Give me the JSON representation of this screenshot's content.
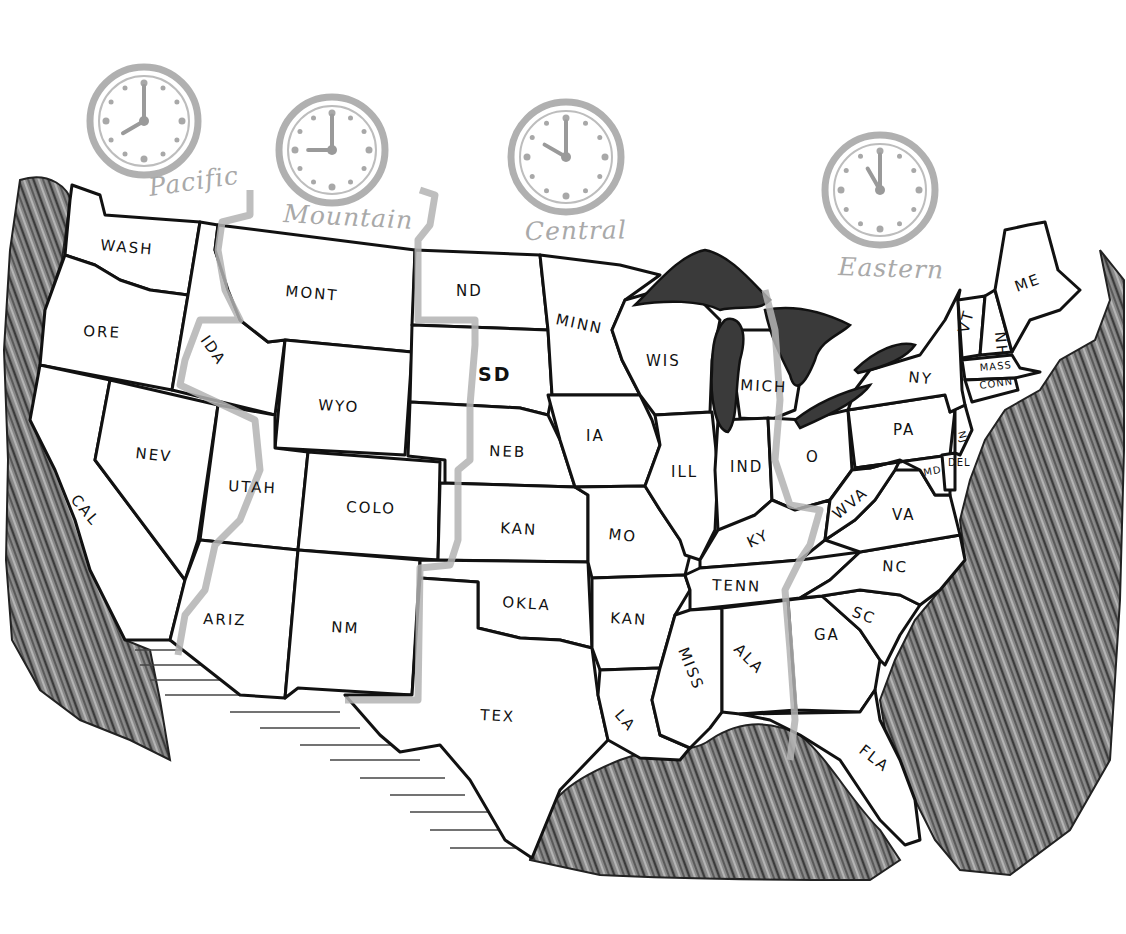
{
  "map": {
    "title": "United States Time Zones",
    "background": "#ffffff",
    "line_color": "#111111",
    "timezone_color": "#a9a9a9",
    "water_color": "#3a3a3a"
  },
  "time_zones": [
    {
      "id": "pacific",
      "label": "Pacific",
      "clock_cx": 144,
      "clock_cy": 121,
      "r": 54,
      "hour": 8,
      "minute": 0,
      "label_x": 150,
      "label_y": 196,
      "label_rot": -8
    },
    {
      "id": "mountain",
      "label": "Mountain",
      "clock_cx": 332,
      "clock_cy": 150,
      "r": 53,
      "hour": 9,
      "minute": 0,
      "label_x": 283,
      "label_y": 222,
      "label_rot": 3
    },
    {
      "id": "central",
      "label": "Central",
      "clock_cx": 566,
      "clock_cy": 157,
      "r": 55,
      "hour": 10,
      "minute": 0,
      "label_x": 525,
      "label_y": 240,
      "label_rot": -1
    },
    {
      "id": "eastern",
      "label": "Eastern",
      "clock_cx": 880,
      "clock_cy": 190,
      "r": 55,
      "hour": 11,
      "minute": 0,
      "label_x": 838,
      "label_y": 275,
      "label_rot": 2
    }
  ],
  "states": [
    {
      "id": "wa",
      "label": "WASH",
      "x": 100,
      "y": 250,
      "rot": 5
    },
    {
      "id": "or",
      "label": "ORE",
      "x": 83,
      "y": 336,
      "rot": 3
    },
    {
      "id": "ca",
      "label": "CAL",
      "x": 70,
      "y": 500,
      "rot": 50
    },
    {
      "id": "nv",
      "label": "NEV",
      "x": 135,
      "y": 458,
      "rot": 6
    },
    {
      "id": "id",
      "label": "IDA",
      "x": 200,
      "y": 340,
      "rot": 55
    },
    {
      "id": "mt",
      "label": "MONT",
      "x": 285,
      "y": 296,
      "rot": 5
    },
    {
      "id": "wy",
      "label": "WYO",
      "x": 318,
      "y": 410,
      "rot": 3
    },
    {
      "id": "ut",
      "label": "UTAH",
      "x": 228,
      "y": 491,
      "rot": 3
    },
    {
      "id": "co",
      "label": "COLO",
      "x": 346,
      "y": 512,
      "rot": 2
    },
    {
      "id": "az",
      "label": "ARIZ",
      "x": 203,
      "y": 624,
      "rot": 2
    },
    {
      "id": "nm",
      "label": "NM",
      "x": 331,
      "y": 632,
      "rot": 3
    },
    {
      "id": "nd",
      "label": "ND",
      "x": 456,
      "y": 296,
      "rot": 0
    },
    {
      "id": "sd",
      "label": "SD",
      "x": 478,
      "y": 381,
      "rot": 0,
      "style": "big"
    },
    {
      "id": "ne",
      "label": "NEB",
      "x": 489,
      "y": 456,
      "rot": 2
    },
    {
      "id": "ks",
      "label": "KAN",
      "x": 500,
      "y": 533,
      "rot": 3
    },
    {
      "id": "ok",
      "label": "OKLA",
      "x": 502,
      "y": 607,
      "rot": 4
    },
    {
      "id": "tx",
      "label": "TEX",
      "x": 480,
      "y": 720,
      "rot": 3
    },
    {
      "id": "mn",
      "label": "MINN",
      "x": 555,
      "y": 324,
      "rot": 12
    },
    {
      "id": "ia",
      "label": "IA",
      "x": 586,
      "y": 441,
      "rot": 0
    },
    {
      "id": "mo",
      "label": "MO",
      "x": 608,
      "y": 539,
      "rot": 6
    },
    {
      "id": "ar",
      "label": "KAN",
      "x": 610,
      "y": 623,
      "rot": 3
    },
    {
      "id": "la",
      "label": "LA",
      "x": 614,
      "y": 715,
      "rot": 50
    },
    {
      "id": "wi",
      "label": "WIS",
      "x": 646,
      "y": 366,
      "rot": 0
    },
    {
      "id": "il",
      "label": "ILL",
      "x": 671,
      "y": 477,
      "rot": 0
    },
    {
      "id": "mi",
      "label": "MICH",
      "x": 740,
      "y": 390,
      "rot": 3
    },
    {
      "id": "in",
      "label": "IND",
      "x": 730,
      "y": 472,
      "rot": 0
    },
    {
      "id": "oh",
      "label": "O",
      "x": 806,
      "y": 462,
      "rot": 0
    },
    {
      "id": "ky",
      "label": "KY",
      "x": 750,
      "y": 548,
      "rot": -25
    },
    {
      "id": "tn",
      "label": "TENN",
      "x": 712,
      "y": 590,
      "rot": 2,
      "style": "bold"
    },
    {
      "id": "ms",
      "label": "MISS",
      "x": 678,
      "y": 650,
      "rot": 68
    },
    {
      "id": "al",
      "label": "ALA",
      "x": 733,
      "y": 650,
      "rot": 45
    },
    {
      "id": "ga",
      "label": "GA",
      "x": 814,
      "y": 640,
      "rot": 0
    },
    {
      "id": "fl",
      "label": "FLA",
      "x": 858,
      "y": 752,
      "rot": 38
    },
    {
      "id": "sc",
      "label": "SC",
      "x": 851,
      "y": 616,
      "rot": 20
    },
    {
      "id": "nc",
      "label": "NC",
      "x": 882,
      "y": 571,
      "rot": 3
    },
    {
      "id": "va",
      "label": "VA",
      "x": 892,
      "y": 520,
      "rot": 0
    },
    {
      "id": "wv",
      "label": "WVA",
      "x": 838,
      "y": 520,
      "rot": -40
    },
    {
      "id": "pa",
      "label": "PA",
      "x": 893,
      "y": 435,
      "rot": 0
    },
    {
      "id": "ny",
      "label": "NY",
      "x": 908,
      "y": 382,
      "rot": 5
    },
    {
      "id": "md",
      "label": "MD",
      "x": 924,
      "y": 476,
      "rot": -10,
      "style": "small"
    },
    {
      "id": "de",
      "label": "DEL",
      "x": 948,
      "y": 466,
      "rot": 0,
      "style": "small"
    },
    {
      "id": "nj",
      "label": "NJ",
      "x": 958,
      "y": 432,
      "rot": 75,
      "style": "small"
    },
    {
      "id": "me",
      "label": "ME",
      "x": 1017,
      "y": 292,
      "rot": -20
    },
    {
      "id": "vt",
      "label": "VT",
      "x": 968,
      "y": 334,
      "rot": -75
    },
    {
      "id": "nh",
      "label": "NH",
      "x": 995,
      "y": 332,
      "rot": 85
    },
    {
      "id": "ma",
      "label": "MASS",
      "x": 980,
      "y": 371,
      "rot": -5,
      "style": "small"
    },
    {
      "id": "ct",
      "label": "CONN",
      "x": 980,
      "y": 389,
      "rot": -8,
      "style": "small"
    }
  ]
}
